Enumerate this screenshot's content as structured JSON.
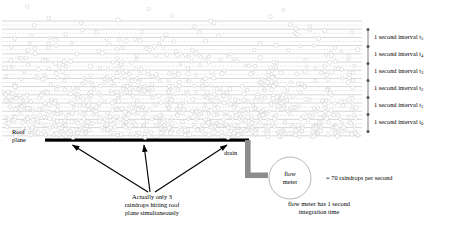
{
  "diagram": {
    "roof_label": "Roof\nplane",
    "roof_label_line1": "Roof",
    "roof_label_line2": "plane",
    "drain_label": "drain",
    "flow_meter_line1": "flow",
    "flow_meter_line2": "meter",
    "rate_label": "= 70 raindrops per second",
    "integration_note_line1": "flow meter has 1 second",
    "integration_note_line2": "integration time",
    "arrow_caption_line1": "Actually only 3",
    "arrow_caption_line2": "raindrops hitting roof",
    "arrow_caption_line3": "plane simultaneously",
    "arrow_caption_full": "Actually only 3 raindrops hitting roof plane simultaneously"
  },
  "intervals": [
    {
      "label": "1 second interval t",
      "sub": "5",
      "y": 38
    },
    {
      "label": "1 second interval t",
      "sub": "4",
      "y": 55
    },
    {
      "label": "1 second interval t",
      "sub": "3",
      "y": 72
    },
    {
      "label": "1 second interval t",
      "sub": "2",
      "y": 89
    },
    {
      "label": "1 second interval t",
      "sub": "1",
      "y": 106
    },
    {
      "label": "1 second interval t",
      "sub": "0",
      "y": 123
    }
  ],
  "colors": {
    "roof": "#000000",
    "drain": "#8c8c8c",
    "raindrop_stroke": "#c9c9c9",
    "raindrop_fill": "#ffffff",
    "interval_line": "#b5b5b5",
    "axis": "#555555",
    "text": "#000000"
  },
  "counts": {
    "drops_per_second": 70,
    "simultaneous_drops": 3,
    "integration_time_seconds": 1,
    "interval_count": 6
  }
}
